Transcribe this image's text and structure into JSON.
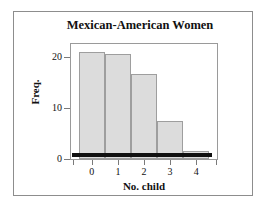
{
  "chart_data": {
    "type": "bar",
    "title": "Mexican-American Women",
    "xlabel": "No. child",
    "ylabel": "Freq.",
    "categories": [
      "0",
      "1",
      "2",
      "3",
      "4"
    ],
    "values": [
      21,
      20.5,
      16.7,
      7.4,
      1.6
    ],
    "ylim": [
      0,
      22.5
    ],
    "yticks": [
      0,
      10,
      20
    ],
    "ytick_labels": [
      "0",
      "10",
      "20"
    ],
    "xtick_labels": [
      "0",
      "1",
      "2",
      "3",
      "4"
    ],
    "grid": false,
    "legend": "none",
    "bar_fill_color": "#dcdcdc",
    "bar_edge_color": "#9e9e9e",
    "baseline_color": "#101010",
    "frame_color": "#9a9a9a",
    "outer_border_color": "#8d8d8d",
    "text_color": "#111111"
  }
}
